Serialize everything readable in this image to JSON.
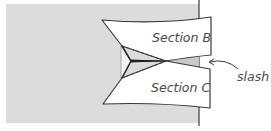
{
  "diagram": {
    "type": "sewing-construction-illustration",
    "labels": {
      "section_b": "Section B",
      "section_c": "Section C",
      "slash": "slash"
    },
    "colors": {
      "background_fabric": "#dcdcdc",
      "section_fill": "#ffffff",
      "outline": "#3a3a3a",
      "text": "#4a4a4a",
      "slash_fill": "#c8c8c8"
    }
  }
}
